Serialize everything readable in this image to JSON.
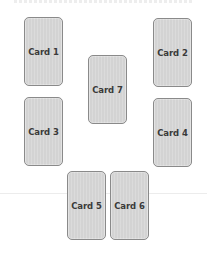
{
  "diagram": {
    "type": "card-layout",
    "cards": [
      {
        "id": "card-1",
        "label": "Card 1",
        "x": 24,
        "y": 17
      },
      {
        "id": "card-2",
        "label": "Card 2",
        "x": 153,
        "y": 18
      },
      {
        "id": "card-7",
        "label": "Card 7",
        "x": 88,
        "y": 55
      },
      {
        "id": "card-3",
        "label": "Card 3",
        "x": 24,
        "y": 97
      },
      {
        "id": "card-4",
        "label": "Card 4",
        "x": 153,
        "y": 98
      },
      {
        "id": "card-5",
        "label": "Card 5",
        "x": 67,
        "y": 171
      },
      {
        "id": "card-6",
        "label": "Card 6",
        "x": 110,
        "y": 171
      }
    ],
    "colors": {
      "card_fill": "#d3d3d3",
      "card_border": "#8a8a8a",
      "card_text": "#3a3a3a",
      "background": "#ffffff"
    }
  }
}
